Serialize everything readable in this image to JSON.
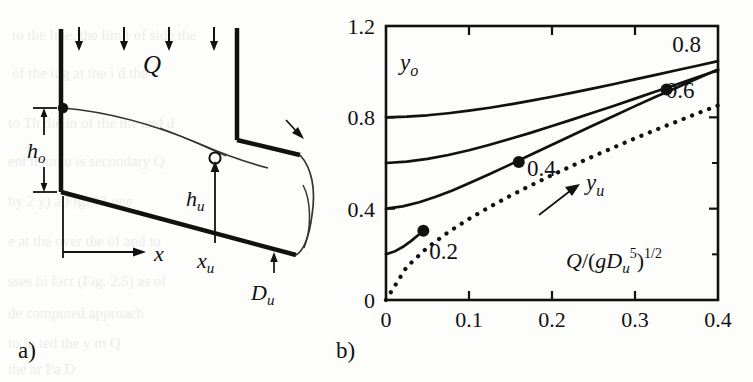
{
  "figure": {
    "panel_a_label": "a)",
    "panel_b_label": "b)"
  },
  "diagram": {
    "name": "weir-outflow-schematic",
    "labels": {
      "Q": "Q",
      "h_o": "h",
      "h_o_sub": "o",
      "h_u": "h",
      "h_u_sub": "u",
      "x": "x",
      "x_u": "x",
      "x_u_sub": "u",
      "D_u": "D",
      "D_u_sub": "u"
    },
    "inflow_arrow_count": 4
  },
  "chart_data": {
    "type": "line",
    "title": "",
    "xlabel": "Q/(gD_u^5)^1/2",
    "xlabel_parts": {
      "q": "Q",
      "slash_open": "/(",
      "g": "g",
      "d": "D",
      "d_sub": "u",
      "d_sup": "5",
      "close": ")",
      "exp": "1/2"
    },
    "ylabel": "y_o",
    "ylabel_parts": {
      "base": "y",
      "sub": "o"
    },
    "annotation_label": "y_u",
    "annotation_parts": {
      "base": "y",
      "sub": "u"
    },
    "xlim": [
      0,
      0.4
    ],
    "ylim": [
      0,
      1.2
    ],
    "xticks": [
      0,
      0.1,
      0.2,
      0.3,
      0.4
    ],
    "xticklabels": [
      "0",
      "0.1",
      "0.2",
      "0.3",
      "0.4"
    ],
    "yticks": [
      0,
      0.4,
      0.8,
      1.2
    ],
    "yticklabels": [
      "0",
      "0.4",
      "0.8",
      "1.2"
    ],
    "grid": false,
    "legend_position": "inline-curve-labels",
    "series": [
      {
        "name": "0.8",
        "label": "0.8",
        "style": "solid",
        "label_x": 0.345,
        "label_y": 1.085,
        "x": [
          0.0,
          0.025,
          0.05,
          0.075,
          0.1,
          0.125,
          0.15,
          0.175,
          0.2,
          0.225,
          0.25,
          0.275,
          0.3,
          0.325,
          0.35,
          0.375,
          0.4
        ],
        "y": [
          0.8,
          0.803,
          0.809,
          0.818,
          0.829,
          0.842,
          0.857,
          0.873,
          0.89,
          0.908,
          0.927,
          0.946,
          0.966,
          0.986,
          1.006,
          1.026,
          1.046
        ]
      },
      {
        "name": "0.6",
        "label": "0.6",
        "style": "solid",
        "label_x": 0.337,
        "label_y": 0.885,
        "x": [
          0.0,
          0.025,
          0.05,
          0.075,
          0.1,
          0.125,
          0.15,
          0.175,
          0.2,
          0.225,
          0.25,
          0.275,
          0.3,
          0.325,
          0.35,
          0.375,
          0.4
        ],
        "y": [
          0.6,
          0.606,
          0.618,
          0.635,
          0.656,
          0.68,
          0.706,
          0.733,
          0.762,
          0.791,
          0.821,
          0.851,
          0.882,
          0.913,
          0.944,
          0.975,
          1.006
        ]
      },
      {
        "name": "0.4",
        "label": "0.4",
        "style": "solid",
        "label_x": 0.17,
        "label_y": 0.545,
        "x": [
          0.0,
          0.02,
          0.04,
          0.06,
          0.08,
          0.1,
          0.125,
          0.15,
          0.175,
          0.2,
          0.225,
          0.25,
          0.275,
          0.3,
          0.325,
          0.35,
          0.375,
          0.4
        ],
        "y": [
          0.4,
          0.41,
          0.428,
          0.452,
          0.48,
          0.511,
          0.552,
          0.594,
          0.637,
          0.68,
          0.723,
          0.765,
          0.807,
          0.849,
          0.89,
          0.93,
          0.97,
          1.01
        ]
      },
      {
        "name": "0.2",
        "label": "0.2",
        "style": "solid",
        "label_x": 0.052,
        "label_y": 0.18,
        "x": [
          0.0,
          0.01,
          0.02,
          0.03,
          0.04,
          0.045
        ],
        "y": [
          0.2,
          0.212,
          0.232,
          0.258,
          0.288,
          0.303
        ]
      },
      {
        "name": "y_u critical line",
        "label": "",
        "style": "dotted",
        "x": [
          0.0,
          0.025,
          0.05,
          0.075,
          0.1,
          0.125,
          0.15,
          0.175,
          0.2,
          0.225,
          0.25,
          0.275,
          0.3,
          0.325,
          0.35,
          0.375,
          0.4
        ],
        "y": [
          0.0,
          0.145,
          0.23,
          0.297,
          0.355,
          0.408,
          0.457,
          0.503,
          0.547,
          0.589,
          0.63,
          0.669,
          0.708,
          0.745,
          0.781,
          0.817,
          0.852
        ]
      }
    ],
    "points": [
      {
        "label": "0.2",
        "x": 0.045,
        "y": 0.303
      },
      {
        "label": "0.4",
        "x": 0.16,
        "y": 0.604
      },
      {
        "label": "0.6",
        "x": 0.338,
        "y": 0.922
      }
    ],
    "point_labels": [
      {
        "text": "0.2",
        "x": 0.052,
        "y": 0.18
      },
      {
        "text": "0.4",
        "x": 0.17,
        "y": 0.545
      },
      {
        "text": "0.6",
        "x": 0.337,
        "y": 0.885
      }
    ],
    "annotation_arrow": {
      "from_x": 0.225,
      "from_y": 0.43,
      "to_x": 0.268,
      "to_y": 0.515
    }
  },
  "background_text": {
    "note": "faint bleed-through text from reverse page",
    "lines": [
      "to the   line,  the limit  of   side    the",
      "of the    ing at  the   i     d  the",
      "to   Th   the   in   of   the  the   and  d",
      "ent   h   ion   u   is   secondary   Q",
      "by     2   y)   a   Fig.   13   one",
      "e    at   the    over    the    of   and   to",
      "sses   hi   fact   (Fig.   2.5)   as    of",
      "de  computed    approach",
      "to  in   ted   the   y   m   Q",
      "the     ar  Pa   D"
    ]
  }
}
